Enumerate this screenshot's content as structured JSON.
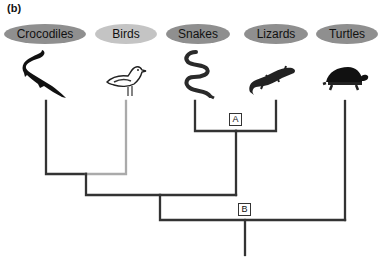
{
  "figure": {
    "panel_label": "(b)",
    "taxa": [
      {
        "name": "Crocodiles",
        "icon": "crocodile-icon"
      },
      {
        "name": "Birds",
        "icon": "bird-icon"
      },
      {
        "name": "Snakes",
        "icon": "snake-icon"
      },
      {
        "name": "Lizards",
        "icon": "lizard-icon"
      },
      {
        "name": "Turtles",
        "icon": "turtle-icon"
      }
    ],
    "nodes": {
      "A": "A",
      "B": "B"
    },
    "colors": {
      "branch": "#333333",
      "bird_branch": "#aaaaaa",
      "pill_dark": "#8f8f8f",
      "pill_light": "#c4c4c4"
    }
  }
}
